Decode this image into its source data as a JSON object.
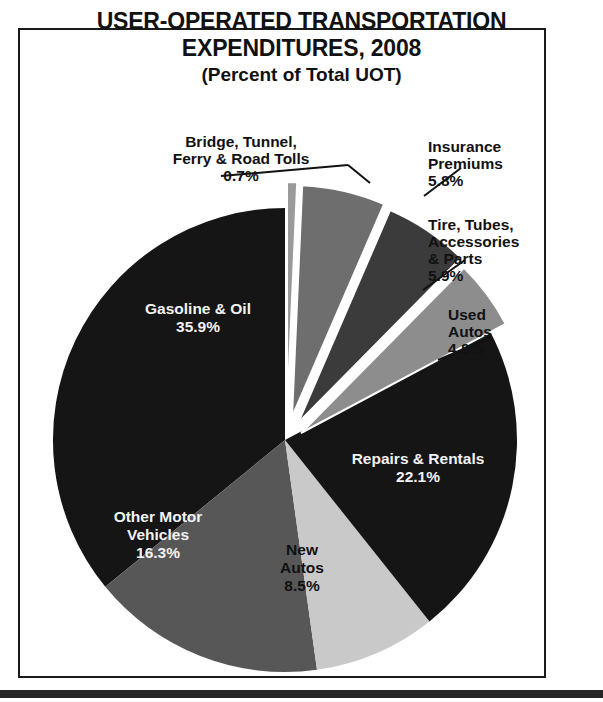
{
  "figure": {
    "title_line_1": "USER-OPERATED TRANSPORTATION",
    "title_line_2": "EXPENDITURES, 2008",
    "title_line_3": "(Percent of Total UOT)"
  },
  "chart_data": {
    "type": "pie",
    "title": "USER-OPERATED TRANSPORTATION EXPENDITURES, 2008",
    "subtitle": "(Percent of Total UOT)",
    "unit": "percent",
    "legend_position": "none",
    "grid": false,
    "labels": [
      "Gasoline & Oil",
      "Other Motor Vehicles",
      "New Autos",
      "Repairs & Rentals",
      "Used Autos",
      "Tire, Tubes, Accessories & Parts",
      "Insurance Premiums",
      "Bridge, Tunnel, Ferry & Road Tolls"
    ],
    "values": [
      35.9,
      16.3,
      8.5,
      22.1,
      4.8,
      5.9,
      5.8,
      0.7
    ],
    "value_labels": [
      "35.9%",
      "16.3%",
      "8.5%",
      "22.1%",
      "4.8%",
      "5.9%",
      "5.8%",
      "0.7%"
    ],
    "colors": [
      "#151515",
      "#575757",
      "#c9c9c9",
      "#151515",
      "#8d8d8d",
      "#3b3b3b",
      "#6e6e6e",
      "#9a9a9a"
    ],
    "exploded": [
      false,
      false,
      false,
      false,
      true,
      true,
      true,
      true
    ],
    "total": 100.0
  },
  "slices": {
    "gasoline": {
      "name": "Gasoline & Oil",
      "pct": "35.9%",
      "line1": "Gasoline & Oil"
    },
    "other": {
      "name": "Other Motor",
      "pct": "16.3%",
      "line1": "Other Motor",
      "line2": "Vehicles"
    },
    "new_autos": {
      "name": "New Autos",
      "pct": "8.5%",
      "line1": "New",
      "line2": "Autos"
    },
    "repairs": {
      "name": "Repairs & Rentals",
      "pct": "22.1%",
      "line1": "Repairs & Rentals"
    },
    "used": {
      "name": "Used Autos",
      "pct": "4.8%",
      "line1": "Used",
      "line2": "Autos"
    },
    "tire": {
      "name": "Tire, Tubes, Accessories & Parts",
      "pct": "5.9%",
      "line1": "Tire, Tubes,",
      "line2": "Accessories",
      "line3": "& Parts"
    },
    "insurance": {
      "name": "Insurance Premiums",
      "pct": "5.8%",
      "line1": "Insurance",
      "line2": "Premiums"
    },
    "bridge": {
      "name": "Bridge, Tunnel, Ferry & Road Tolls",
      "pct": "0.7%",
      "line1": "Bridge, Tunnel,",
      "line2": "Ferry & Road Tolls"
    }
  }
}
